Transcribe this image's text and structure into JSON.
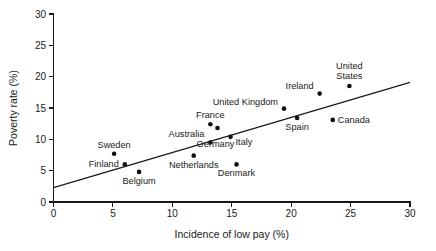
{
  "chart_data": {
    "type": "scatter",
    "title": "",
    "xlabel": "Incidence of low pay (%)",
    "ylabel": "Poverty rate (%)",
    "xlim": [
      0,
      30
    ],
    "ylim": [
      0,
      30
    ],
    "xticks": [
      0,
      5,
      10,
      15,
      20,
      25,
      30
    ],
    "yticks": [
      0,
      5,
      10,
      15,
      20,
      25,
      30
    ],
    "xtick_labels": [
      "0",
      "5",
      "10",
      "15",
      "20",
      "25",
      "30"
    ],
    "ytick_labels": [
      "0",
      "5",
      "10",
      "15",
      "20",
      "25",
      "30"
    ],
    "grid": false,
    "legend": "none",
    "marker_color": "#111111",
    "line_color": "#1a1a1a",
    "points": [
      {
        "label": "Sweden",
        "x": 5.1,
        "y": 7.7,
        "label_dx": 0,
        "label_dy": -6,
        "anchor": "middle"
      },
      {
        "label": "Finland",
        "x": 6.0,
        "y": 6.0,
        "label_dx": -6,
        "label_dy": 3,
        "anchor": "end"
      },
      {
        "label": "Belgium",
        "x": 7.2,
        "y": 4.8,
        "label_dx": 0,
        "label_dy": 12,
        "anchor": "middle"
      },
      {
        "label": "Netherlands",
        "x": 11.8,
        "y": 7.4,
        "label_dx": 0,
        "label_dy": 12,
        "anchor": "middle"
      },
      {
        "label": "France",
        "x": 13.2,
        "y": 12.4,
        "label_dx": 0,
        "label_dy": -6,
        "anchor": "middle"
      },
      {
        "label": "Australia",
        "x": 13.2,
        "y": 9.5,
        "label_dx": -6,
        "label_dy": -5,
        "anchor": "end"
      },
      {
        "label": "Germany",
        "x": 13.8,
        "y": 11.8,
        "label_dx": -2,
        "label_dy": 19,
        "anchor": "middle"
      },
      {
        "label": "Italy",
        "x": 14.9,
        "y": 10.4,
        "label_dx": 5,
        "label_dy": 8,
        "anchor": "start"
      },
      {
        "label": "Denmark",
        "x": 15.4,
        "y": 6.0,
        "label_dx": 0,
        "label_dy": 12,
        "anchor": "middle"
      },
      {
        "label": "United Kingdom",
        "x": 19.4,
        "y": 14.9,
        "label_dx": -6,
        "label_dy": -4,
        "anchor": "end"
      },
      {
        "label": "Spain",
        "x": 20.5,
        "y": 13.4,
        "label_dx": 0,
        "label_dy": 12,
        "anchor": "middle"
      },
      {
        "label": "Ireland",
        "x": 22.4,
        "y": 17.3,
        "label_dx": -6,
        "label_dy": -5,
        "anchor": "end"
      },
      {
        "label": "Canada",
        "x": 23.5,
        "y": 13.1,
        "label_dx": 5,
        "label_dy": 3,
        "anchor": "start"
      },
      {
        "label": "United States",
        "x": 24.9,
        "y": 18.5,
        "label_dx": 0,
        "label_dy": -17,
        "anchor": "middle",
        "multiline": [
          "United",
          "States"
        ]
      }
    ],
    "trendline": {
      "x0": 0.0,
      "y0": 2.3,
      "x1": 30.0,
      "y1": 19.1
    }
  }
}
